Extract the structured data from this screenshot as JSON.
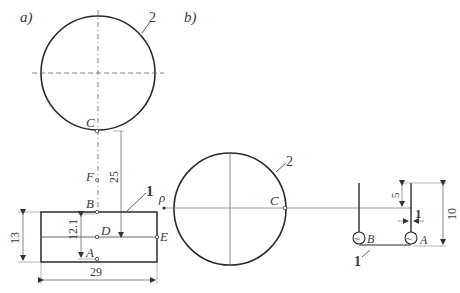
{
  "panels": {
    "a": {
      "label": "a)",
      "circle_label": "2",
      "points": {
        "C": "C",
        "F": "F",
        "B": "B",
        "D": "D",
        "A": "A",
        "E": "E"
      },
      "part_label": "1",
      "dims": {
        "distance": "25",
        "height": "13",
        "width": "29",
        "inner": "12.1"
      }
    },
    "b": {
      "label": "b)",
      "circle_label": "2",
      "points": {
        "C": "C",
        "rho": "ρ",
        "B": "B",
        "A": "A"
      },
      "part_label": "1",
      "dims": {
        "offset": "5",
        "height": "10",
        "gap": "1"
      },
      "source_symbol": "~"
    }
  },
  "colors": {
    "stroke": "#2a2a2a",
    "thin": "#777777"
  }
}
